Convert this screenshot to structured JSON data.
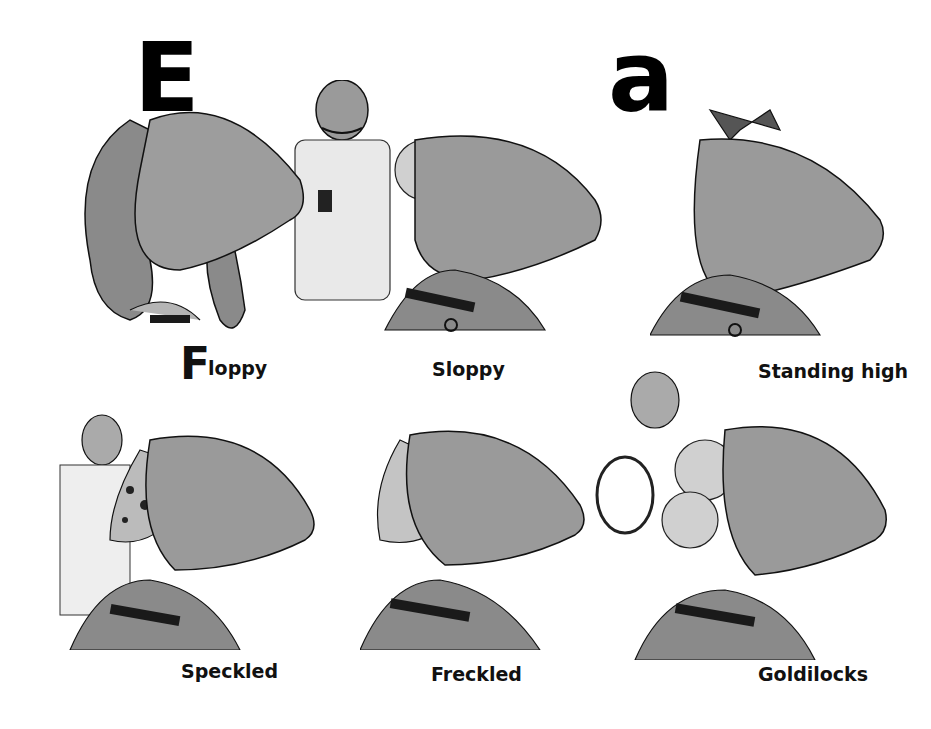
{
  "header": {
    "letter_left": "E",
    "letter_right": "a"
  },
  "panels": [
    {
      "id": "floppy",
      "label_cap": "F",
      "label_rest": "loppy",
      "description": "dog head with long wavy floppy ears, man with curled mustache in white coat"
    },
    {
      "id": "sloppy",
      "label": "Sloppy",
      "description": "dog head with curly messy hair tuft"
    },
    {
      "id": "standing-high",
      "label": "Standing high",
      "description": "dog head with upright pointed ears"
    },
    {
      "id": "speckled",
      "label": "Speckled",
      "description": "dog with spotted ear, man behind with hands"
    },
    {
      "id": "freckled",
      "label": "Freckled",
      "description": "dog with dotted folded ear"
    },
    {
      "id": "goldilocks",
      "label": "Goldilocks",
      "description": "dog with curly golden locks wig, man holding hand mirror"
    }
  ],
  "colors": {
    "ink": "#111111",
    "wash": "#8a8a8a",
    "wash_light": "#b5b5b5",
    "collar": "#1a1a1a",
    "paper": "#ffffff"
  }
}
